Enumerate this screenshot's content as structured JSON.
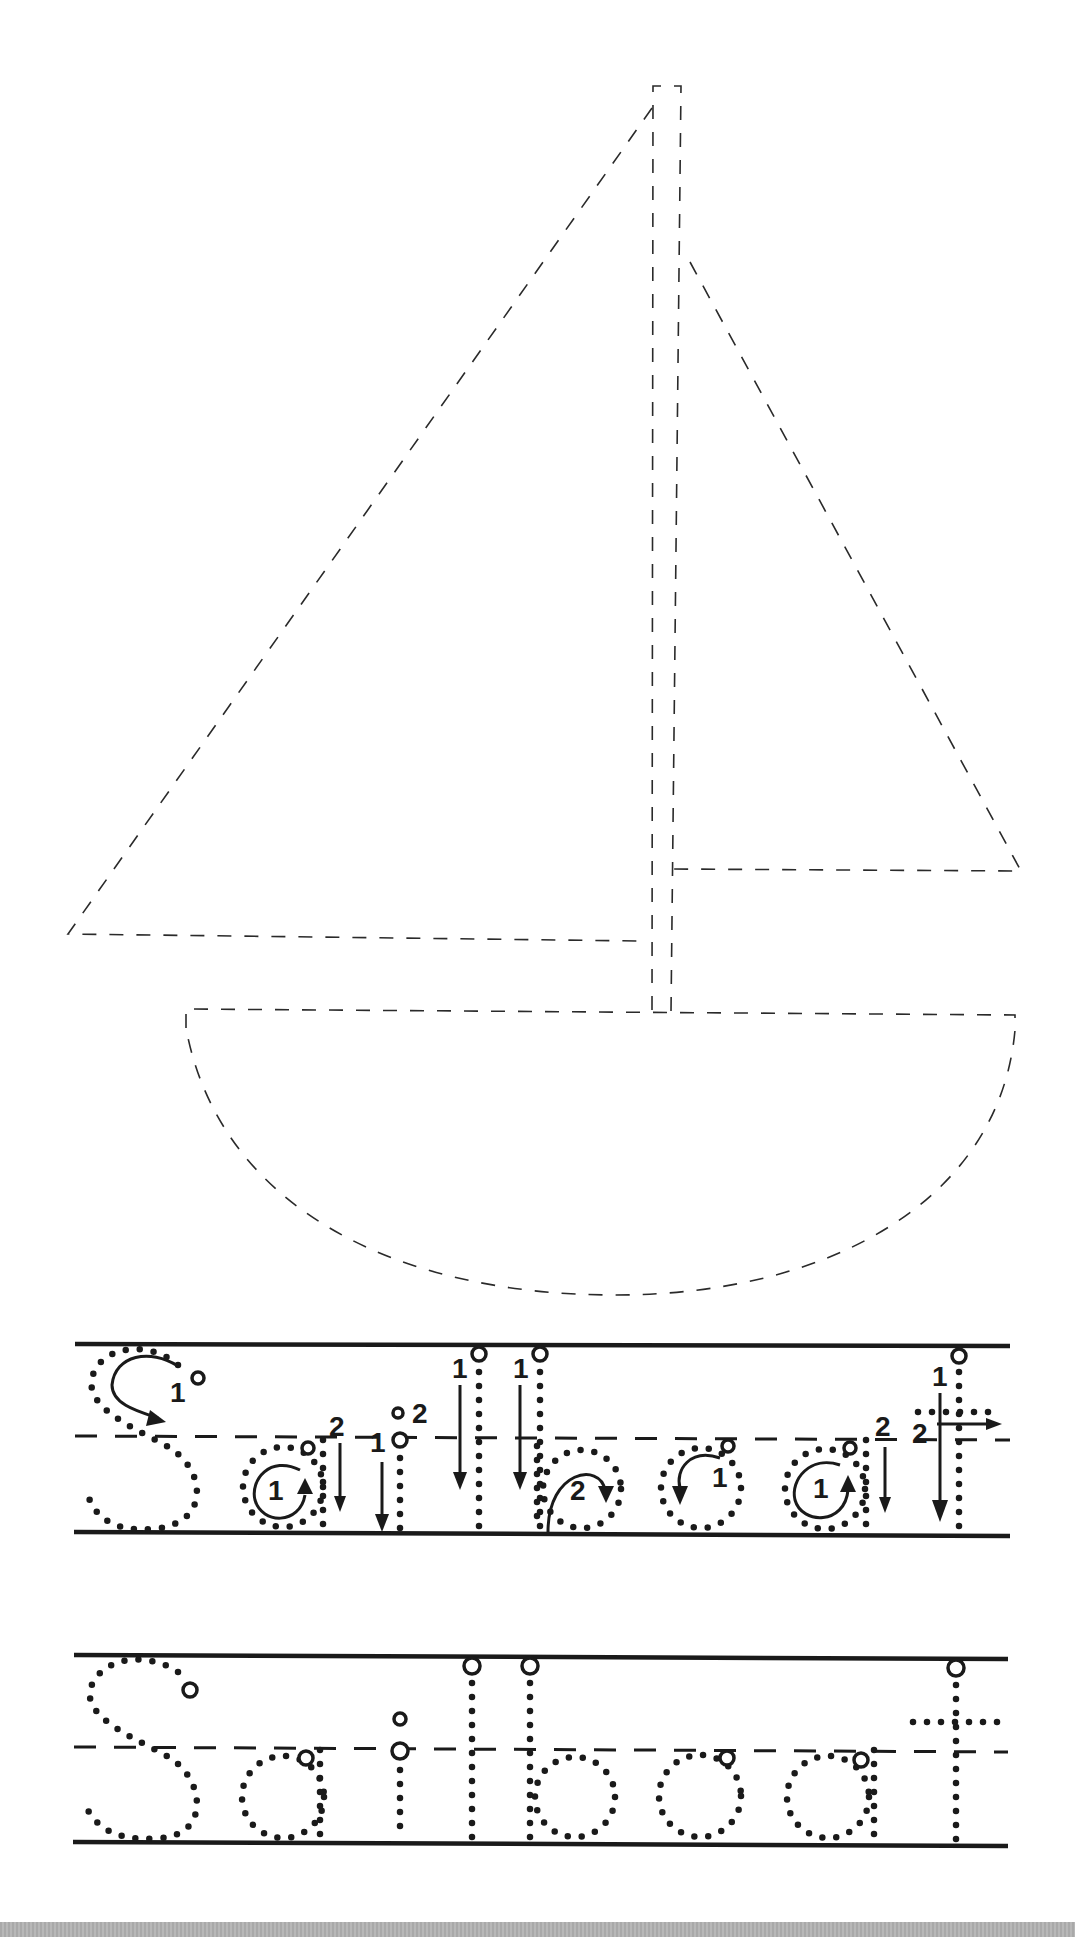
{
  "worksheet": {
    "word": "Sailboat",
    "picture": "sailboat",
    "rows": [
      {
        "type": "guided",
        "letters": [
          "S",
          "a",
          "i",
          "l",
          "b",
          "o",
          "a",
          "t"
        ]
      },
      {
        "type": "trace",
        "letters": [
          "S",
          "a",
          "i",
          "l",
          "b",
          "o",
          "a",
          "t"
        ]
      }
    ],
    "stroke_labels": {
      "S": [
        "1"
      ],
      "a1": [
        "1",
        "2"
      ],
      "i": [
        "1",
        "2"
      ],
      "l1": [
        "1"
      ],
      "l2": [
        "1"
      ],
      "b": [
        "2"
      ],
      "o": [
        "1"
      ],
      "a2": [
        "1",
        "2"
      ],
      "t": [
        "1",
        "2"
      ]
    },
    "colors": {
      "ink": "#1a1a1a",
      "paper": "#ffffff",
      "footer": "#b0b0b0"
    }
  }
}
